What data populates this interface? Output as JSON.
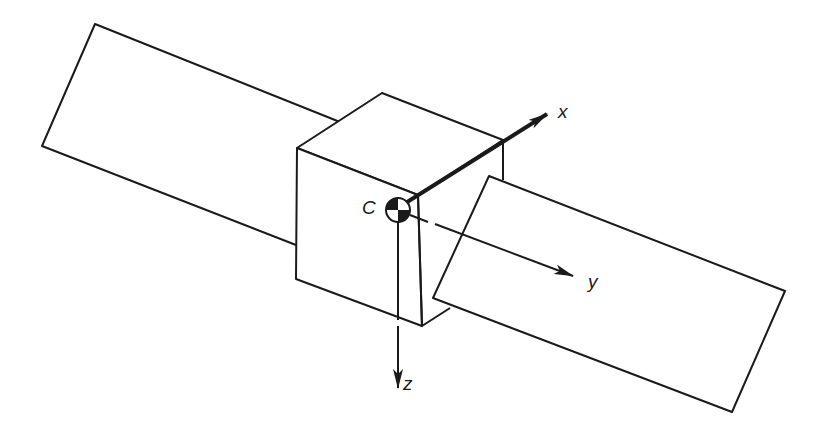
{
  "diagram": {
    "title": "",
    "labels": {
      "center": "C",
      "x_axis": "x",
      "y_axis": "y",
      "z_axis": "z"
    },
    "colors": {
      "stroke": "#1a1a1a",
      "background": "#ffffff"
    },
    "elements": [
      "left solar panel",
      "spacecraft body cube",
      "right solar panel",
      "center of mass marker C",
      "x axis arrow",
      "y axis arrow",
      "z axis arrow"
    ]
  }
}
